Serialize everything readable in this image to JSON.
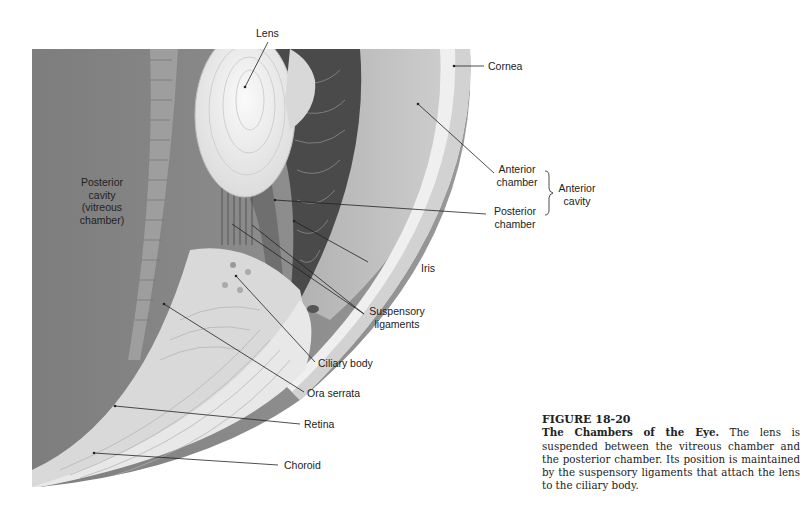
{
  "figure": {
    "number": "FIGURE 18-20",
    "title": "The Chambers of the Eye.",
    "caption_text": "The lens is suspended between the vitreous chamber and the posterior chamber. Its position is maintained by the suspensory ligaments that attach the lens to the ciliary body."
  },
  "labels": {
    "lens": "Lens",
    "cornea": "Cornea",
    "posterior_cavity_1": "Posterior",
    "posterior_cavity_2": "cavity",
    "posterior_cavity_3": "(vitreous",
    "posterior_cavity_4": "chamber)",
    "anterior_chamber_1": "Anterior",
    "anterior_chamber_2": "chamber",
    "anterior_cavity_1": "Anterior",
    "anterior_cavity_2": "cavity",
    "posterior_chamber_1": "Posterior",
    "posterior_chamber_2": "chamber",
    "iris": "Iris",
    "suspensory_1": "Suspensory",
    "suspensory_2": "ligaments",
    "ciliary_body": "Ciliary body",
    "ora_serrata": "Ora serrata",
    "retina": "Retina",
    "choroid": "Choroid"
  },
  "colors": {
    "vitreous": "#8a8a8a",
    "lens": "#f2f2f2",
    "iris": "#4a4a4a",
    "anterior": "#bdbdbd",
    "cornea": "#e6e6e6",
    "ciliary": "#d8d8d8",
    "text": "#222222"
  }
}
